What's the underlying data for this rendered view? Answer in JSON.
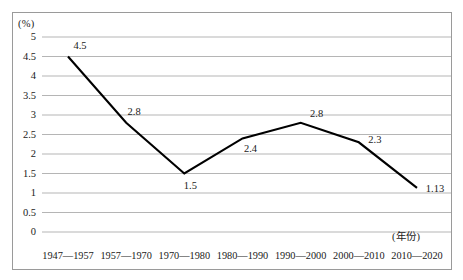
{
  "chart_data": {
    "type": "line",
    "title": "",
    "xlabel": "(年份)",
    "ylabel": "(%)",
    "ylim": [
      0,
      5
    ],
    "grid": true,
    "legend": false,
    "categories": [
      "1947—1957",
      "1957—1970",
      "1970—1980",
      "1980—1990",
      "1990—2000",
      "2000—2010",
      "2010—2020"
    ],
    "values": [
      4.5,
      2.8,
      1.5,
      2.4,
      2.8,
      2.3,
      1.13
    ],
    "point_labels": [
      "4.5",
      "2.8",
      "1.5",
      "2.4",
      "2.8",
      "2.3",
      "1.13"
    ],
    "y_ticks": [
      "5",
      "4.5",
      "4",
      "3.5",
      "3",
      "2.5",
      "2",
      "1.5",
      "1",
      "0.5",
      "0"
    ],
    "y_tick_values": [
      5,
      4.5,
      4,
      3.5,
      3,
      2.5,
      2,
      1.5,
      1,
      0.5,
      0
    ],
    "line_color": "#000000",
    "grid_color": "#b5b5b5",
    "frame_color": "#9a9a9a"
  }
}
